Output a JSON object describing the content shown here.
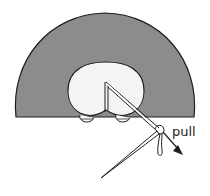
{
  "diagram": {
    "labels": {
      "pull": "pull"
    },
    "colors": {
      "fabric": "#8c8c8c",
      "opening": "#f4f4f4",
      "outline": "#1e1e1e",
      "background": "#ffffff"
    }
  }
}
